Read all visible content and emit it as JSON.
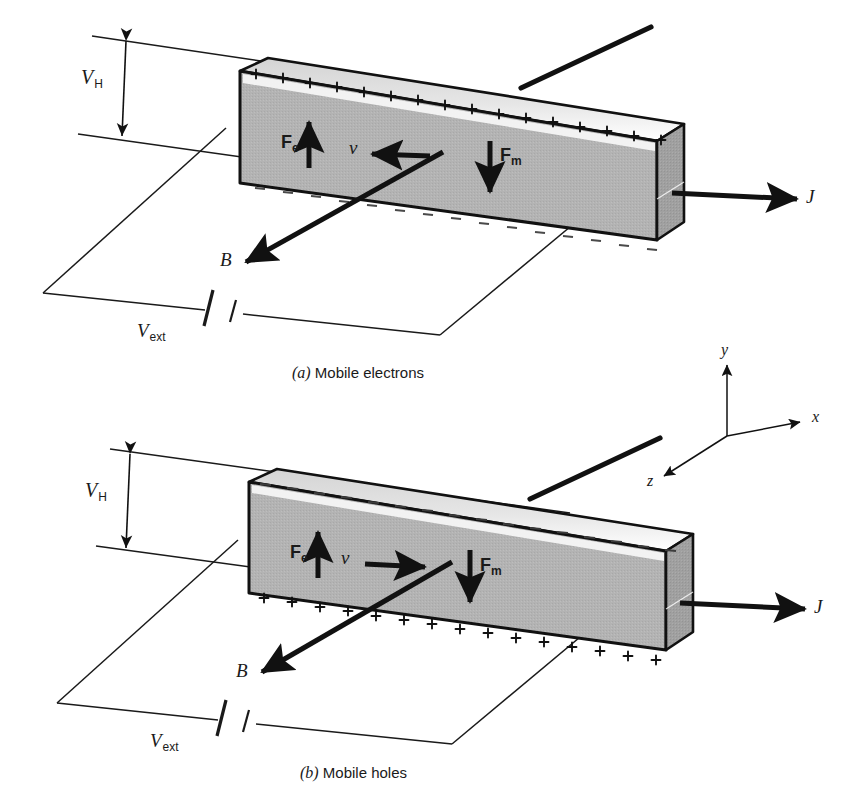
{
  "figure": {
    "background_color": "#ffffff",
    "ink_color": "#111111",
    "slab_front_color": "#b3b3b3",
    "slab_top_color": "#e8e8e8",
    "slab_end_color": "#9a9a9a",
    "wire_color": "#1a1a1a"
  },
  "panels": [
    {
      "id": "a",
      "caption_marker": "(a)",
      "caption_text": "Mobile electrons",
      "top_surface_sign": "+",
      "top_surface_count": 16,
      "bottom_surface_sign": "–",
      "bottom_surface_count": 15,
      "labels": {
        "hall_voltage": "V",
        "hall_voltage_sub": "H",
        "external_voltage": "V",
        "external_voltage_sub": "ext",
        "force_electric": "F",
        "force_electric_sub": "e",
        "force_magnetic": "F",
        "force_magnetic_sub": "m",
        "velocity": "v",
        "magnetic_field": "B",
        "current_density": "J"
      },
      "velocity_direction": "left",
      "force_electric_direction": "up",
      "force_magnetic_direction": "down",
      "magnetic_field_direction": "down-left",
      "current_density_direction": "right"
    },
    {
      "id": "b",
      "caption_marker": "(b)",
      "caption_text": "Mobile holes",
      "top_surface_sign": "–",
      "top_surface_count": 16,
      "bottom_surface_sign": "+",
      "bottom_surface_count": 15,
      "labels": {
        "hall_voltage": "V",
        "hall_voltage_sub": "H",
        "external_voltage": "V",
        "external_voltage_sub": "ext",
        "force_electric": "F",
        "force_electric_sub": "e",
        "force_magnetic": "F",
        "force_magnetic_sub": "m",
        "velocity": "v",
        "magnetic_field": "B",
        "current_density": "J"
      },
      "velocity_direction": "right",
      "force_electric_direction": "up",
      "force_magnetic_direction": "down",
      "magnetic_field_direction": "down-left",
      "current_density_direction": "right"
    }
  ],
  "axes": {
    "y_label": "y",
    "x_label": "x",
    "z_label": "z",
    "y_direction": "up",
    "x_direction": "right",
    "z_direction": "down-left"
  }
}
